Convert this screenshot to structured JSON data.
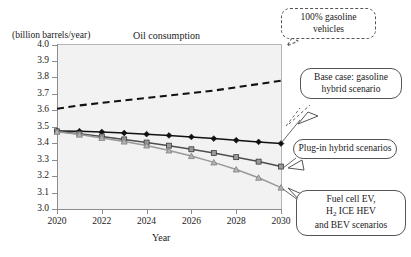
{
  "figure": {
    "unit_label": "(billion barrels/year)",
    "title": "Oil consumption",
    "xlabel": "Year"
  },
  "callouts": {
    "gasoline": "100% gasoline vehicles",
    "base_case": "Base case: gasoline hybrid scenario",
    "plugin": "Plug-in hybrid scenarios",
    "fuelcell_line1": "Fuel cell EV,",
    "fuelcell_line2_pre": "H",
    "fuelcell_line2_sub": "2",
    "fuelcell_line2_post": " ICE HEV",
    "fuelcell_line3": "and BEV scenarios"
  },
  "colors": {
    "plot_background": "#f2f2f2",
    "axis": "#8c8c8c",
    "series_black": "#111111",
    "series_dark_gray": "#4d4d4d",
    "series_light_gray": "#999999",
    "callout_border": "#555555"
  },
  "chart_data": {
    "type": "line",
    "title": "Oil consumption",
    "xlabel": "Year",
    "ylabel": "(billion barrels/year)",
    "xlim": [
      2020,
      2030
    ],
    "ylim": [
      3.0,
      4.0
    ],
    "xticks": [
      2020,
      2022,
      2024,
      2026,
      2028,
      2030
    ],
    "yticks": [
      3.0,
      3.1,
      3.2,
      3.3,
      3.4,
      3.5,
      3.6,
      3.7,
      3.8,
      3.9,
      4.0
    ],
    "ytick_labels": [
      "3.0",
      "3.1",
      "3.2",
      "3.3",
      "3.4",
      "3.5",
      "3.6",
      "3.7",
      "3.8",
      "3.9",
      "4.0"
    ],
    "xtick_labels": [
      "2020",
      "2022",
      "2024",
      "2026",
      "2028",
      "2030"
    ],
    "grid": false,
    "legend": "annotations",
    "x": [
      2020,
      2021,
      2022,
      2023,
      2024,
      2025,
      2026,
      2027,
      2028,
      2029,
      2030
    ],
    "series": [
      {
        "name": "100% gasoline vehicles",
        "style": "dashed",
        "marker": "none",
        "color": "#111111",
        "values": [
          3.61,
          3.63,
          3.645,
          3.66,
          3.675,
          3.69,
          3.705,
          3.72,
          3.74,
          3.76,
          3.78
        ]
      },
      {
        "name": "Base case: gasoline hybrid scenario",
        "style": "solid",
        "marker": "diamond",
        "color": "#111111",
        "values": [
          3.475,
          3.473,
          3.468,
          3.462,
          3.455,
          3.447,
          3.438,
          3.428,
          3.418,
          3.408,
          3.398
        ]
      },
      {
        "name": "Plug-in hybrid scenarios",
        "style": "solid",
        "marker": "square",
        "color": "#4d4d4d",
        "values": [
          3.472,
          3.458,
          3.441,
          3.423,
          3.404,
          3.385,
          3.363,
          3.34,
          3.315,
          3.288,
          3.258
        ]
      },
      {
        "name": "Fuel cell EV, H2 ICE HEV and BEV scenarios",
        "style": "solid",
        "marker": "triangle",
        "color": "#999999",
        "values": [
          3.47,
          3.452,
          3.432,
          3.41,
          3.386,
          3.356,
          3.322,
          3.283,
          3.24,
          3.19,
          3.13
        ]
      }
    ]
  }
}
